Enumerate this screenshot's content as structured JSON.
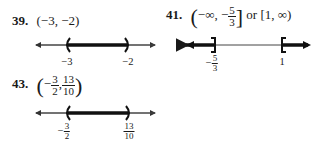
{
  "problems": [
    {
      "number": "39.",
      "answer_text": "(−3, −2)",
      "number_line": {
        "endpoints": [
          {
            "label": "−3",
            "type": "open",
            "symbol": "("
          },
          {
            "label": "−2",
            "type": "open",
            "symbol": ")"
          }
        ],
        "shaded": "between"
      }
    },
    {
      "number": "41.",
      "answer_parts": {
        "open": "(",
        "neg_inf": "−∞, −",
        "frac_num": "5",
        "frac_den": "3",
        "close": "]",
        "connector": "or",
        "second_interval": "[1, ∞)"
      },
      "number_line": {
        "endpoints": [
          {
            "label_sign": "−",
            "label_num": "5",
            "label_den": "3",
            "type": "closed",
            "symbol": "]"
          },
          {
            "label": "1",
            "type": "closed",
            "symbol": "["
          }
        ],
        "shaded": "outside"
      }
    },
    {
      "number": "43.",
      "answer_parts": {
        "open": "(",
        "sign": "−",
        "frac1_num": "3",
        "frac1_den": "2",
        "comma": ",",
        "frac2_num": "13",
        "frac2_den": "10",
        "close": ")"
      },
      "number_line": {
        "endpoints": [
          {
            "label_sign": "−",
            "label_num": "3",
            "label_den": "2",
            "type": "open",
            "symbol": "("
          },
          {
            "label_num": "13",
            "label_den": "10",
            "type": "open",
            "symbol": ")"
          }
        ],
        "shaded": "between"
      }
    }
  ]
}
